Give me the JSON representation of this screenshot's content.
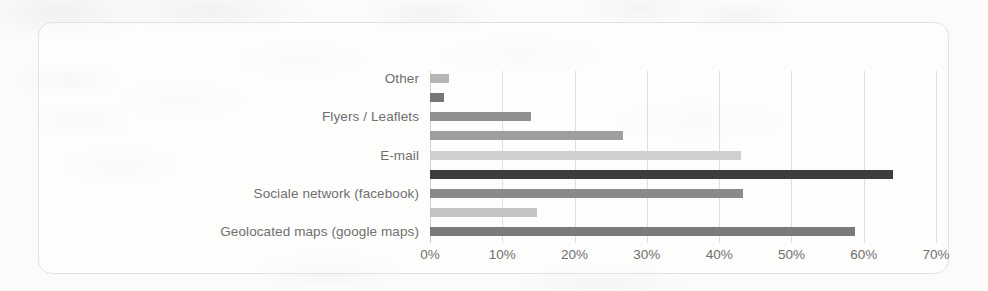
{
  "chart_data": {
    "type": "bar",
    "orientation": "horizontal",
    "title": "",
    "subtitle": "",
    "xlabel": "",
    "ylabel": "",
    "xlim": [
      0,
      70
    ],
    "xtick_labels": [
      "0%",
      "10%",
      "20%",
      "30%",
      "40%",
      "50%",
      "60%",
      "70%"
    ],
    "xtick_values": [
      0,
      10,
      20,
      30,
      40,
      50,
      60,
      70
    ],
    "grid": true,
    "legend": "none",
    "categories": [
      "Other",
      "",
      "Flyers / Leaflets",
      "",
      "E-mail",
      "",
      "Sociale network (facebook)",
      "",
      "Geolocated maps (google maps)"
    ],
    "bars": [
      {
        "label": "Other",
        "value": 2.6,
        "color": "#b6b6b6"
      },
      {
        "label": "",
        "value": 1.9,
        "color": "#777777"
      },
      {
        "label": "Flyers / Leaflets",
        "value": 14.0,
        "color": "#8f8f8f"
      },
      {
        "label": "",
        "value": 26.7,
        "color": "#9e9e9e"
      },
      {
        "label": "E-mail",
        "value": 43.0,
        "color": "#cfcfcf"
      },
      {
        "label": "",
        "value": 64.0,
        "color": "#3d3d3d"
      },
      {
        "label": "Sociale network (facebook)",
        "value": 43.3,
        "color": "#8a8a8a"
      },
      {
        "label": "",
        "value": 14.8,
        "color": "#c3c3c3"
      },
      {
        "label": "Geolocated maps (google maps)",
        "value": 58.8,
        "color": "#7a7a7a"
      }
    ],
    "values": [
      2.6,
      1.9,
      14.0,
      26.7,
      43.0,
      64.0,
      43.3,
      14.8,
      58.8
    ],
    "colors": {
      "gridline": "#dedede",
      "axis": "#d2d2d2",
      "frame": "#e2e2e2",
      "text": "#6f6f6f",
      "background": "#fbfbfa"
    }
  }
}
